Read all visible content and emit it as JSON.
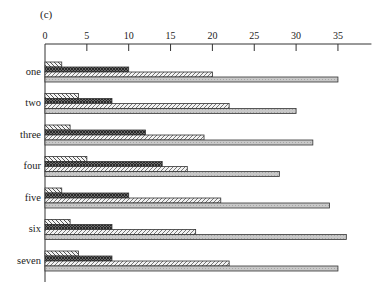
{
  "chart_data": {
    "type": "bar",
    "orientation": "horizontal",
    "title": "(c)",
    "xlabel": "",
    "ylabel": "",
    "xlim": [
      0,
      39
    ],
    "x_ticks": [
      0,
      5,
      10,
      15,
      20,
      25,
      30,
      35
    ],
    "x_axis_position": "top",
    "grid": false,
    "legend": null,
    "categories": [
      "one",
      "two",
      "three",
      "four",
      "five",
      "six",
      "seven"
    ],
    "series": [
      {
        "name": "series 1",
        "pattern": "back-diagonal-hatch",
        "values": [
          2,
          4,
          3,
          5,
          2,
          3,
          4
        ]
      },
      {
        "name": "series 2",
        "pattern": "dark-crosshatch",
        "values": [
          10,
          8,
          12,
          14,
          10,
          8,
          8
        ]
      },
      {
        "name": "series 3",
        "pattern": "forward-diagonal-hatch",
        "values": [
          20,
          22,
          19,
          17,
          21,
          18,
          22
        ]
      },
      {
        "name": "series 4",
        "pattern": "light-gray-dotted",
        "values": [
          35,
          30,
          32,
          28,
          34,
          36,
          35
        ]
      }
    ]
  }
}
